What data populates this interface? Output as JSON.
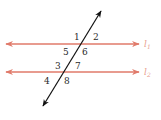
{
  "diagram": {
    "type": "parallel-lines-transversal",
    "colors": {
      "parallel_lines": "#e07a6a",
      "transversal": "#111111",
      "angle_labels": "#2a2a2a",
      "line_labels": "#e8a090"
    },
    "lines": [
      {
        "id": "l1",
        "name": "l",
        "subscript": "1",
        "y": 44
      },
      {
        "id": "l2",
        "name": "l",
        "subscript": "2",
        "y": 72
      }
    ],
    "transversal": {
      "start": [
        43,
        106
      ],
      "end": [
        100,
        12
      ]
    },
    "angles": [
      {
        "number": "1",
        "x": 76,
        "y": 38
      },
      {
        "number": "2",
        "x": 94,
        "y": 38
      },
      {
        "number": "5",
        "x": 64,
        "y": 54
      },
      {
        "number": "6",
        "x": 82,
        "y": 54
      },
      {
        "number": "3",
        "x": 56,
        "y": 69
      },
      {
        "number": "7",
        "x": 76,
        "y": 69
      },
      {
        "number": "4",
        "x": 45,
        "y": 84
      },
      {
        "number": "8",
        "x": 64,
        "y": 84
      }
    ]
  }
}
